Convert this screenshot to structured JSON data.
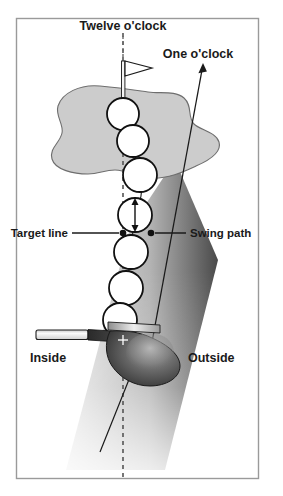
{
  "figure": {
    "background_color": "#ffffff",
    "border_color": "#9a9a9a"
  },
  "labels": {
    "twelve_oclock": "Twelve o'clock",
    "one_oclock": "One o'clock",
    "target_line": "Target line",
    "swing_path": "Swing path",
    "inside": "Inside",
    "outside": "Outside"
  },
  "colors": {
    "green_fill": "#cccccc",
    "green_stroke": "#6e6e6e",
    "band_light": "#d6d6d6",
    "band_dark": "#4a4a4a",
    "ball_fill": "#ffffff",
    "ball_stroke": "#111111",
    "line_color": "#1a1a1a",
    "club_head_dark": "#3a3a3a",
    "club_shaft_light": "#f2f2f2",
    "text_color": "#1a1a1a"
  },
  "elements": {
    "flag_label": "flag",
    "green_label": "putting green",
    "band_label": "swing path band",
    "club_label": "golf club",
    "ball_count": 7
  },
  "balls": [
    {
      "cx": 123,
      "cy": 114,
      "r": 16
    },
    {
      "cx": 133,
      "cy": 141,
      "r": 16
    },
    {
      "cx": 140,
      "cy": 175,
      "r": 17
    },
    {
      "cx": 135,
      "cy": 215,
      "r": 17
    },
    {
      "cx": 131,
      "cy": 252,
      "r": 17
    },
    {
      "cx": 126,
      "cy": 288,
      "r": 17
    },
    {
      "cx": 120,
      "cy": 320,
      "r": 17
    }
  ],
  "target_line": {
    "x": 123,
    "y_top": 33,
    "y_bottom": 478,
    "style": "dashed"
  },
  "swing_arrow": {
    "x_start": 150,
    "y_start": 353,
    "x_end": 202,
    "y_end": 66
  },
  "callouts": {
    "target_line_dot": {
      "x": 123,
      "y": 233
    },
    "swing_path_dot": {
      "x": 151,
      "y": 233
    }
  }
}
